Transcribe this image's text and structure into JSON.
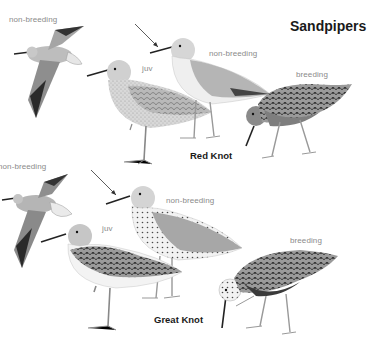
{
  "page": {
    "title": "Sandpipers"
  },
  "species": [
    {
      "name": "Red Knot",
      "plumages": [
        {
          "label": "non-breeding",
          "pose": "flying"
        },
        {
          "label": "juv",
          "pose": "standing"
        },
        {
          "label": "non-breeding",
          "pose": "standing"
        },
        {
          "label": "breeding",
          "pose": "foraging"
        }
      ]
    },
    {
      "name": "Great Knot",
      "plumages": [
        {
          "label": "non-breeding",
          "pose": "flying"
        },
        {
          "label": "juv",
          "pose": "standing"
        },
        {
          "label": "non-breeding",
          "pose": "standing"
        },
        {
          "label": "breeding",
          "pose": "foraging"
        }
      ]
    }
  ],
  "colors": {
    "background": "#ffffff",
    "label_text": "#8a8a8a",
    "title_text": "#1a1a1a"
  }
}
